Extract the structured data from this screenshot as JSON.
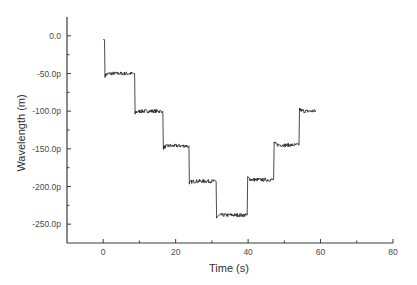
{
  "chart_data": {
    "type": "line",
    "title": "",
    "xlabel": "Time (s)",
    "ylabel": "Wavelength (m)",
    "xlim": [
      -10,
      80
    ],
    "ylim": [
      -275,
      25
    ],
    "x_ticks": [
      0,
      20,
      40,
      60,
      80
    ],
    "x_tick_labels": [
      "0",
      "20",
      "40",
      "60",
      "80"
    ],
    "x_minor_ticks": [
      -10,
      10,
      30,
      50,
      70
    ],
    "y_ticks": [
      0,
      -50,
      -100,
      -150,
      -200,
      -250
    ],
    "y_tick_labels": [
      "0.0",
      "-50.0p",
      "-100.0p",
      "-150.0p",
      "-200.0p",
      "-250.0p"
    ],
    "y_minor_ticks": [
      -25,
      -75,
      -125,
      -175,
      -225
    ],
    "y_unit_prefix": "p",
    "grid": false,
    "legend": null,
    "series": [
      {
        "name": "Wavelength shift",
        "description": "Staircase trace: wavelength stepped down then back up in ~50 pm steps",
        "noise_amplitude": 2.5,
        "start": {
          "t": 0.0,
          "value": -5
        },
        "plateaus": [
          {
            "t_start": 0.5,
            "t_end": 8.3,
            "value": -50
          },
          {
            "t_start": 8.8,
            "t_end": 16.1,
            "value": -100
          },
          {
            "t_start": 16.6,
            "t_end": 23.3,
            "value": -146
          },
          {
            "t_start": 23.8,
            "t_end": 30.8,
            "value": -193
          },
          {
            "t_start": 31.3,
            "t_end": 39.5,
            "value": -238
          },
          {
            "t_start": 39.9,
            "t_end": 46.8,
            "value": -191
          },
          {
            "t_start": 47.2,
            "t_end": 53.8,
            "value": -145
          },
          {
            "t_start": 54.2,
            "t_end": 58.7,
            "value": -100
          }
        ]
      }
    ]
  }
}
